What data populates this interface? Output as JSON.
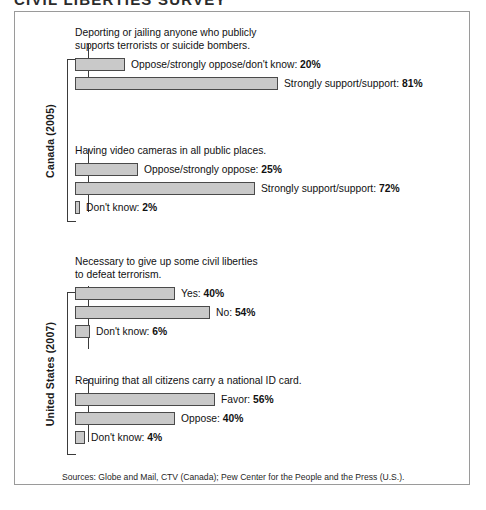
{
  "title_sliver": "CIVIL LIBERTIES SURVEY",
  "chart_data": {
    "type": "bar",
    "xlabel": "",
    "ylabel": "",
    "xlim": [
      0,
      100
    ],
    "grid": false,
    "legend": "none",
    "orientation": "horizontal",
    "value_suffix": "%",
    "groups": [
      {
        "name": "Canada (2005)",
        "questions": [
          {
            "title": "Deporting or jailing anyone who publicly\nsupports terrorists or suicide bombers.",
            "categories": [
              "Oppose/strongly oppose/don't know",
              "Strongly support/support"
            ],
            "values": [
              20,
              81
            ],
            "bars": [
              {
                "label": "Oppose/strongly oppose/don't know: ",
                "value": 20,
                "value_text": "20%"
              },
              {
                "label": "Strongly support/support: ",
                "value": 81,
                "value_text": "81%"
              }
            ]
          },
          {
            "title": "Having video cameras in all public places.",
            "categories": [
              "Oppose/strongly oppose",
              "Strongly support/support",
              "Don't know"
            ],
            "values": [
              25,
              72,
              2
            ],
            "bars": [
              {
                "label": "Oppose/strongly oppose: ",
                "value": 25,
                "value_text": "25%"
              },
              {
                "label": "Strongly support/support: ",
                "value": 72,
                "value_text": "72%"
              },
              {
                "label": "Don't know: ",
                "value": 2,
                "value_text": "2%"
              }
            ]
          }
        ]
      },
      {
        "name": "United States (2007)",
        "questions": [
          {
            "title": "Necessary to give up some civil liberties\nto defeat terrorism.",
            "categories": [
              "Yes",
              "No",
              "Don't know"
            ],
            "values": [
              40,
              54,
              6
            ],
            "bars": [
              {
                "label": "Yes: ",
                "value": 40,
                "value_text": "40%"
              },
              {
                "label": "No: ",
                "value": 54,
                "value_text": "54%"
              },
              {
                "label": "Don't know: ",
                "value": 6,
                "value_text": "6%"
              }
            ]
          },
          {
            "title": "Requiring that all citizens carry a national ID card.",
            "categories": [
              "Favor",
              "Oppose",
              "Don't know"
            ],
            "values": [
              56,
              40,
              4
            ],
            "bars": [
              {
                "label": "Favor: ",
                "value": 56,
                "value_text": "56%"
              },
              {
                "label": "Oppose: ",
                "value": 40,
                "value_text": "40%"
              },
              {
                "label": "Don't know: ",
                "value": 4,
                "value_text": "4%"
              }
            ]
          }
        ]
      }
    ]
  },
  "sources": "Sources: Globe and Mail, CTV (Canada); Pew Center for the People and the Press (U.S.).",
  "colors": {
    "bar_fill": "#c9c9c9",
    "bar_border": "#4a4a4a",
    "frame_border": "#9a9a9a",
    "text": "#111111"
  },
  "layout": {
    "px_per_percent": 2.5,
    "bar_origin_x": 74
  }
}
